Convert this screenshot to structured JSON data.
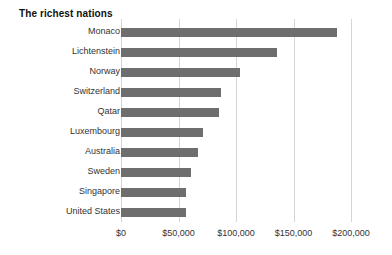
{
  "chart_data": {
    "type": "bar",
    "orientation": "horizontal",
    "title": "The richest nations",
    "xlabel": "",
    "ylabel": "",
    "categories": [
      "Monaco",
      "Lichtenstein",
      "Norway",
      "Switzerland",
      "Qatar",
      "Luxembourg",
      "Australia",
      "Sweden",
      "Singapore",
      "United States"
    ],
    "values": [
      187800,
      135600,
      103500,
      87000,
      85200,
      71300,
      67000,
      61000,
      56500,
      56200
    ],
    "xlim": [
      0,
      200000
    ],
    "xticks": [
      0,
      50000,
      100000,
      150000,
      200000
    ],
    "xtick_labels": [
      "$0",
      "$50,000",
      "$100,000",
      "$150,000",
      "$200,000"
    ],
    "grid": true,
    "grid_axis": "x",
    "legend": false,
    "colors": {
      "bar": "#6e6e6e",
      "gridline": "#d5d5d5",
      "title_text": "#111111",
      "label_text": "#333333",
      "background": "#ffffff"
    }
  }
}
